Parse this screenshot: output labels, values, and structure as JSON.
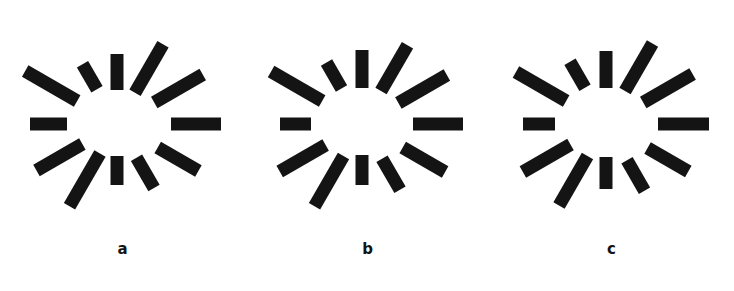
{
  "sheet": {
    "width": 734,
    "height": 291,
    "background_color": "#ffffff",
    "bar_color": "#141414",
    "description": "Three radial sunburst bar figures labeled a, b and c"
  },
  "figures": [
    {
      "id": "figure-a",
      "label": "a",
      "panel_x": 0,
      "center_x": 117,
      "center_y": 124,
      "bar_width": 13,
      "chart_data": {
        "type": "bar",
        "title": "a",
        "categories": [
          "0",
          "30",
          "60",
          "90",
          "120",
          "150",
          "180",
          "210",
          "240",
          "270",
          "300",
          "330"
        ],
        "values": [
          50,
          47,
          35,
          29,
          61,
          53,
          37,
          60,
          29,
          36,
          56,
          56
        ],
        "inner_radii": [
          54,
          47,
          39,
          32,
          34,
          40,
          50,
          46,
          40,
          34,
          36,
          43
        ],
        "xlabel": "angle (degrees)",
        "ylabel": "bar length (px)",
        "ylim": [
          0,
          70
        ]
      },
      "bars": [
        {
          "angle": 0,
          "inner": 54,
          "length": 50
        },
        {
          "angle": 330,
          "inner": 47,
          "length": 47
        },
        {
          "angle": 300,
          "inner": 39,
          "length": 35
        },
        {
          "angle": 270,
          "inner": 32,
          "length": 29
        },
        {
          "angle": 240,
          "inner": 34,
          "length": 61
        },
        {
          "angle": 210,
          "inner": 40,
          "length": 53
        },
        {
          "angle": 180,
          "inner": 50,
          "length": 37
        },
        {
          "angle": 150,
          "inner": 46,
          "length": 60
        },
        {
          "angle": 120,
          "inner": 40,
          "length": 29
        },
        {
          "angle": 90,
          "inner": 34,
          "length": 36
        },
        {
          "angle": 60,
          "inner": 36,
          "length": 56
        },
        {
          "angle": 30,
          "inner": 43,
          "length": 56
        }
      ]
    },
    {
      "id": "figure-b",
      "label": "b",
      "panel_x": 245,
      "center_x": 117,
      "center_y": 124,
      "bar_width": 13,
      "chart_data": {
        "type": "bar",
        "title": "b",
        "categories": [
          "0",
          "30",
          "60",
          "90",
          "120",
          "150",
          "180",
          "210",
          "240",
          "270",
          "300",
          "330"
        ],
        "values": [
          50,
          49,
          36,
          30,
          58,
          53,
          31,
          59,
          30,
          38,
          53,
          56
        ],
        "inner_radii": [
          51,
          47,
          40,
          31,
          37,
          42,
          51,
          46,
          41,
          36,
          38,
          42
        ],
        "xlabel": "angle (degrees)",
        "ylabel": "bar length (px)",
        "ylim": [
          0,
          70
        ]
      },
      "bars": [
        {
          "angle": 0,
          "inner": 51,
          "length": 50
        },
        {
          "angle": 330,
          "inner": 47,
          "length": 49
        },
        {
          "angle": 300,
          "inner": 40,
          "length": 36
        },
        {
          "angle": 270,
          "inner": 31,
          "length": 30
        },
        {
          "angle": 240,
          "inner": 37,
          "length": 58
        },
        {
          "angle": 210,
          "inner": 42,
          "length": 53
        },
        {
          "angle": 180,
          "inner": 51,
          "length": 31
        },
        {
          "angle": 150,
          "inner": 46,
          "length": 59
        },
        {
          "angle": 120,
          "inner": 41,
          "length": 30
        },
        {
          "angle": 90,
          "inner": 36,
          "length": 38
        },
        {
          "angle": 60,
          "inner": 38,
          "length": 53
        },
        {
          "angle": 30,
          "inner": 42,
          "length": 56
        }
      ]
    },
    {
      "id": "figure-c",
      "label": "c",
      "panel_x": 489,
      "center_x": 117,
      "center_y": 124,
      "bar_width": 13,
      "chart_data": {
        "type": "bar",
        "title": "c",
        "categories": [
          "0",
          "30",
          "60",
          "90",
          "120",
          "150",
          "180",
          "210",
          "240",
          "270",
          "300",
          "330"
        ],
        "values": [
          51,
          47,
          35,
          32,
          57,
          55,
          32,
          58,
          30,
          37,
          55,
          57
        ],
        "inner_radii": [
          52,
          48,
          42,
          33,
          37,
          41,
          51,
          46,
          42,
          36,
          38,
          43
        ],
        "xlabel": "angle (degrees)",
        "ylabel": "bar length (px)",
        "ylim": [
          0,
          70
        ]
      },
      "bars": [
        {
          "angle": 0,
          "inner": 52,
          "length": 51
        },
        {
          "angle": 330,
          "inner": 48,
          "length": 47
        },
        {
          "angle": 300,
          "inner": 42,
          "length": 35
        },
        {
          "angle": 270,
          "inner": 33,
          "length": 32
        },
        {
          "angle": 240,
          "inner": 37,
          "length": 57
        },
        {
          "angle": 210,
          "inner": 41,
          "length": 55
        },
        {
          "angle": 180,
          "inner": 51,
          "length": 32
        },
        {
          "angle": 150,
          "inner": 46,
          "length": 58
        },
        {
          "angle": 120,
          "inner": 42,
          "length": 30
        },
        {
          "angle": 90,
          "inner": 36,
          "length": 37
        },
        {
          "angle": 60,
          "inner": 38,
          "length": 55
        },
        {
          "angle": 30,
          "inner": 43,
          "length": 57
        }
      ]
    }
  ]
}
